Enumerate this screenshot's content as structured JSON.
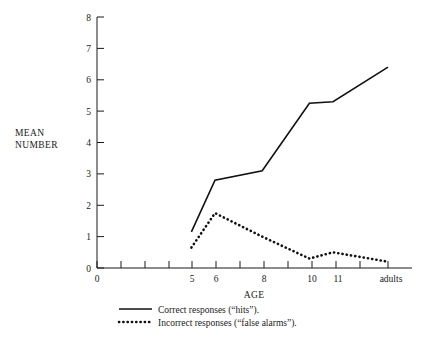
{
  "chart_data": {
    "type": "line",
    "title": "",
    "xlabel": "AGE",
    "ylabel": "MEAN NUMBER",
    "x": [
      5,
      6,
      8,
      10,
      11,
      "adults"
    ],
    "categories": [
      "5",
      "6",
      "8",
      "10",
      "11",
      "adults"
    ],
    "xtick_labels": [
      "0",
      "5",
      "6",
      "8",
      "10",
      "11",
      "adults"
    ],
    "ytick_labels": [
      "0",
      "1",
      "2",
      "3",
      "4",
      "5",
      "6",
      "7",
      "8"
    ],
    "ylim": [
      0,
      8
    ],
    "grid": false,
    "legend_position": "below-axes-left",
    "series": [
      {
        "name": "Correct responses (“hits”).",
        "style": "solid",
        "values": [
          1.15,
          2.8,
          3.1,
          5.25,
          5.3,
          6.4
        ]
      },
      {
        "name": "Incorrect responses (“false alarms”).",
        "style": "dotted",
        "values": [
          0.65,
          1.75,
          1.0,
          0.3,
          0.5,
          0.2
        ]
      }
    ]
  },
  "axes": {
    "y_title_line1": "MEAN",
    "y_title_line2": "NUMBER",
    "x_title": "AGE",
    "y_ticks": [
      "8",
      "7",
      "6",
      "5",
      "4",
      "3",
      "2",
      "1",
      "0"
    ],
    "x_origin_label": "0",
    "x_ticks": [
      "5",
      "6",
      "8",
      "10",
      "11",
      "adults"
    ]
  },
  "legend": {
    "items": [
      {
        "key": "solid",
        "label": "Correct responses (“hits”)."
      },
      {
        "key": "dotted",
        "label": "Incorrect responses (“false alarms”)."
      }
    ]
  }
}
